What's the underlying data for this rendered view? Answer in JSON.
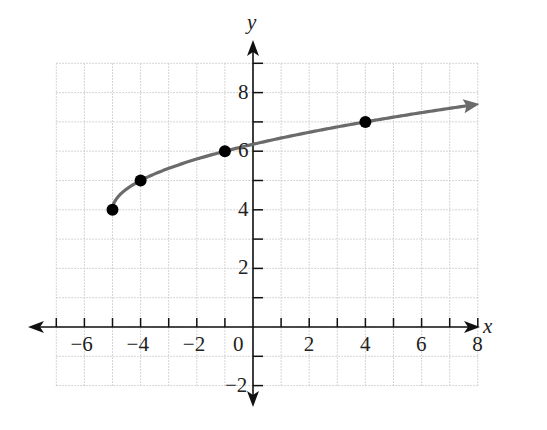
{
  "chart_data": {
    "type": "line",
    "title": "",
    "xlabel": "x",
    "ylabel": "y",
    "xlim": [
      -7,
      8
    ],
    "ylim": [
      -2,
      9
    ],
    "grid": true,
    "x_ticks": [
      -6,
      -4,
      -2,
      0,
      2,
      4,
      6,
      8
    ],
    "y_ticks": [
      -2,
      2,
      4,
      6,
      8
    ],
    "x_tick_labels": [
      "−6",
      "−4",
      "−2",
      "0",
      "2",
      "4",
      "6",
      "8"
    ],
    "y_tick_labels": [
      "−2",
      "2",
      "4",
      "6",
      "8"
    ],
    "series": [
      {
        "name": "curve",
        "function": "y = sqrt(x + 5) + 4",
        "domain_start": -5,
        "continues_right": true,
        "color": "#6b6b6b",
        "points": [
          {
            "x": -5,
            "y": 4
          },
          {
            "x": -4,
            "y": 5
          },
          {
            "x": -1,
            "y": 6
          },
          {
            "x": 4,
            "y": 7
          }
        ]
      }
    ],
    "legend": null
  },
  "labels": {
    "x_axis": "x",
    "y_axis": "y"
  }
}
